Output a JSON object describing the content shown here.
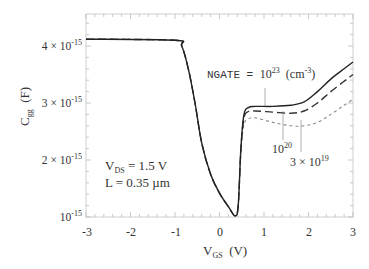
{
  "chart_data": {
    "type": "line",
    "title": "",
    "xlabel": "V_GS (V)",
    "xlabel_main": "V",
    "xlabel_sub": "GS",
    "xlabel_unit": "(V)",
    "ylabel": "C_gg (F)",
    "ylabel_main": "C",
    "ylabel_sub": "gg",
    "ylabel_unit": "(F)",
    "xlim": [
      -3,
      3
    ],
    "ylim": [
      1e-15,
      4.58e-15
    ],
    "grid": false,
    "x_ticks": [
      "-3",
      "-2",
      "-1",
      "0",
      "1",
      "2",
      "3"
    ],
    "y_ticks": [
      {
        "value": 4e-15,
        "mantissa": "4 × 10",
        "exp": "-15"
      },
      {
        "value": 3e-15,
        "mantissa": "3 × 10",
        "exp": "-15"
      },
      {
        "value": 2e-15,
        "mantissa": "2 × 10",
        "exp": "-15"
      },
      {
        "value": 1e-15,
        "mantissa": "10",
        "exp": "-15"
      }
    ],
    "annotations": {
      "conditions_line1_main": "V",
      "conditions_line1_sub": "DS",
      "conditions_line1_rest": " = 1.5 V",
      "conditions_line2": "L = 0.35 µm",
      "ngate_prefix": "NGATE = ",
      "ngate_value_base": "10",
      "ngate_value_exp": "23",
      "ngate_unit_pre": "(cm",
      "ngate_unit_exp": "-3",
      "ngate_unit_post": ")",
      "label_1e20_base": "10",
      "label_1e20_exp": "20",
      "label_3e19_base": "3 × 10",
      "label_3e19_exp": "19"
    },
    "series": [
      {
        "name": "NGATE = 1e23 cm^-3",
        "style": "solid",
        "color": "#222222",
        "x": [
          -3.0,
          -1.0,
          -0.85,
          -0.7,
          -0.55,
          -0.4,
          -0.2,
          0.0,
          0.2,
          0.35,
          0.42,
          0.48,
          0.55,
          0.65,
          0.8,
          1.2,
          1.6,
          1.9,
          2.2,
          2.5,
          2.8,
          3.0
        ],
        "y": [
          4.12,
          4.1,
          4.0,
          3.6,
          3.0,
          2.3,
          1.75,
          1.42,
          1.18,
          1.02,
          1.2,
          2.2,
          2.8,
          2.92,
          2.94,
          2.94,
          2.96,
          3.02,
          3.2,
          3.42,
          3.6,
          3.72
        ],
        "y_scale": 1e-15
      },
      {
        "name": "NGATE = 1e20 cm^-3",
        "style": "dashed",
        "color": "#333333",
        "x": [
          -3.0,
          -1.0,
          -0.85,
          -0.7,
          -0.55,
          -0.4,
          -0.2,
          0.0,
          0.2,
          0.35,
          0.42,
          0.48,
          0.55,
          0.65,
          0.8,
          1.2,
          1.6,
          1.9,
          2.2,
          2.5,
          2.8,
          3.0
        ],
        "y": [
          4.12,
          4.1,
          4.0,
          3.6,
          3.0,
          2.3,
          1.75,
          1.42,
          1.18,
          1.02,
          1.2,
          2.18,
          2.74,
          2.85,
          2.86,
          2.84,
          2.82,
          2.86,
          3.0,
          3.2,
          3.38,
          3.5
        ],
        "y_scale": 1e-15
      },
      {
        "name": "NGATE = 3e19 cm^-3",
        "style": "dotted",
        "color": "#8a8a8a",
        "x": [
          -3.0,
          -1.0,
          -0.85,
          -0.7,
          -0.55,
          -0.4,
          -0.2,
          0.0,
          0.2,
          0.35,
          0.42,
          0.48,
          0.55,
          0.65,
          0.8,
          1.2,
          1.6,
          1.9,
          2.2,
          2.5,
          2.8,
          3.0
        ],
        "y": [
          4.12,
          4.1,
          4.0,
          3.6,
          3.0,
          2.3,
          1.75,
          1.42,
          1.18,
          1.02,
          1.2,
          2.15,
          2.62,
          2.72,
          2.74,
          2.66,
          2.6,
          2.6,
          2.66,
          2.8,
          2.96,
          3.06
        ],
        "y_scale": 1e-15
      }
    ]
  }
}
